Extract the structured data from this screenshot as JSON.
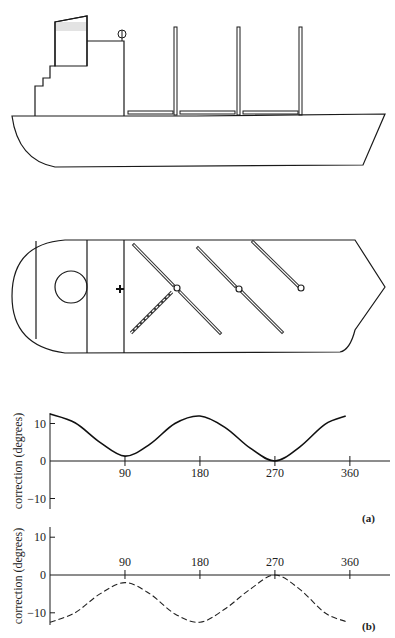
{
  "figure": {
    "side_view": {
      "label": "ship-side-elevation",
      "derricks": 3,
      "booms": 3
    },
    "plan_view": {
      "label": "ship-plan-view",
      "booms_solid": 5,
      "booms_dashed": 1,
      "pivots": 3
    }
  },
  "chart_data": [
    {
      "type": "line",
      "panel_label": "(a)",
      "title": "",
      "xlabel": "",
      "ylabel": "correction (degrees)",
      "x_ticks": [
        "90",
        "180",
        "270",
        "360"
      ],
      "x_tick_values": [
        90,
        180,
        270,
        360
      ],
      "y_ticks": [
        "10",
        "0",
        "−10"
      ],
      "y_tick_values": [
        10,
        0,
        -10
      ],
      "xlim": [
        0,
        380
      ],
      "ylim": [
        -13,
        13
      ],
      "grid": false,
      "line_style": "solid",
      "series": [
        {
          "name": "correction (a)",
          "x": [
            0,
            30,
            60,
            90,
            120,
            150,
            180,
            210,
            240,
            270,
            300,
            330,
            355
          ],
          "y": [
            12.5,
            10.2,
            5.0,
            1.3,
            4.5,
            10.0,
            12.0,
            9.0,
            3.5,
            0.0,
            3.8,
            9.8,
            12.0
          ]
        }
      ]
    },
    {
      "type": "line",
      "panel_label": "(b)",
      "title": "",
      "xlabel": "",
      "ylabel": "correction (degrees)",
      "x_ticks": [
        "90",
        "180",
        "270",
        "360"
      ],
      "x_tick_values": [
        90,
        180,
        270,
        360
      ],
      "y_ticks": [
        "10",
        "0",
        "−10"
      ],
      "y_tick_values": [
        10,
        0,
        -10
      ],
      "xlim": [
        0,
        380
      ],
      "ylim": [
        -13,
        13
      ],
      "grid": false,
      "line_style": "dashed",
      "series": [
        {
          "name": "correction (b)",
          "x": [
            0,
            30,
            60,
            90,
            120,
            150,
            180,
            210,
            240,
            270,
            300,
            330,
            355
          ],
          "y": [
            -12.5,
            -10.0,
            -5.0,
            -2.0,
            -5.0,
            -10.3,
            -12.5,
            -9.0,
            -3.8,
            0.0,
            -3.8,
            -10.0,
            -12.3
          ]
        }
      ]
    }
  ]
}
